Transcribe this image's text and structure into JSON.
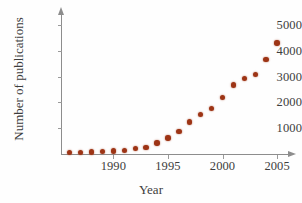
{
  "chart_data": {
    "type": "scatter",
    "title": "",
    "xlabel": "Year",
    "ylabel": "Number of publications",
    "xlim": [
      1985.2,
      2006.0
    ],
    "ylim": [
      0,
      5700
    ],
    "grid": false,
    "legend": null,
    "marker_color": "#9d3415",
    "axis_color": "#8d8d8d",
    "x_ticks": [
      1990,
      1995,
      2000,
      2005
    ],
    "x_tick_labels": [
      "1990",
      "1995",
      "2000",
      "2005"
    ],
    "y_ticks": [
      1000,
      2000,
      3000,
      4000,
      5000
    ],
    "y_tick_labels": [
      "1000",
      "2000",
      "3000",
      "4000",
      "5000"
    ],
    "x": [
      1986,
      1987,
      1988,
      1989,
      1990,
      1991,
      1992,
      1993,
      1994,
      1995,
      1996,
      1997,
      1998,
      1999,
      2000,
      2001,
      2002,
      2003,
      2004,
      2005
    ],
    "values": [
      60,
      70,
      80,
      95,
      110,
      140,
      210,
      260,
      400,
      560,
      840,
      1060,
      1380,
      1620,
      1990,
      2440,
      2680,
      2820,
      3350,
      3900
    ],
    "points": [
      {
        "year": 1986,
        "publications": 60
      },
      {
        "year": 1987,
        "publications": 70
      },
      {
        "year": 1988,
        "publications": 80
      },
      {
        "year": 1989,
        "publications": 95
      },
      {
        "year": 1990,
        "publications": 110
      },
      {
        "year": 1991,
        "publications": 140
      },
      {
        "year": 1992,
        "publications": 210
      },
      {
        "year": 1993,
        "publications": 260
      },
      {
        "year": 1994,
        "publications": 430
      },
      {
        "year": 1995,
        "publications": 620
      },
      {
        "year": 1996,
        "publications": 880
      },
      {
        "year": 1997,
        "publications": 1240
      },
      {
        "year": 1998,
        "publications": 1540
      },
      {
        "year": 1999,
        "publications": 1760
      },
      {
        "year": 2000,
        "publications": 2180
      },
      {
        "year": 2001,
        "publications": 2680
      },
      {
        "year": 2002,
        "publications": 2930
      },
      {
        "year": 2003,
        "publications": 3080
      },
      {
        "year": 2004,
        "publications": 3660
      },
      {
        "year": 2005,
        "publications": 4300
      }
    ]
  },
  "axes": {
    "x_title": "Year",
    "y_title": "Number of publications"
  }
}
